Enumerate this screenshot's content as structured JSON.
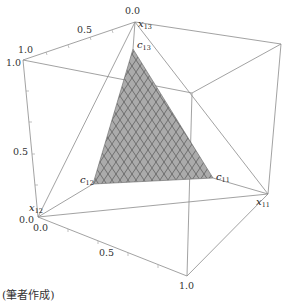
{
  "diagram": {
    "type": "3d-cube-simplex",
    "axes": {
      "x13": {
        "label": "x",
        "sub": "13",
        "ticks": [
          "0.0",
          "0.5",
          "1.0"
        ]
      },
      "x12": {
        "label": "x",
        "sub": "12",
        "ticks": [
          "0.0",
          "0.5",
          "1.0"
        ]
      },
      "x11": {
        "label": "x",
        "sub": "11",
        "ticks": [
          "0.0",
          "0.5",
          "1.0"
        ]
      }
    },
    "tick_labels": {
      "top_origin": "0.0",
      "top_mid": "0.5",
      "top_end": "1.0",
      "left_end": "1.0",
      "left_mid": "0.5",
      "left_origin": "0.0",
      "bottom_origin": "0.0",
      "bottom_mid": "0.5",
      "bottom_end": "1.0"
    },
    "vertex_labels": {
      "c13": {
        "label": "c",
        "sub": "13"
      },
      "c12": {
        "label": "c",
        "sub": "12"
      },
      "c11": {
        "label": "c",
        "sub": "11"
      }
    },
    "colors": {
      "edge": "#8a8a8a",
      "fill": "#a9a9a9",
      "mesh": "#555555"
    }
  },
  "caption": "(筆者作成)"
}
